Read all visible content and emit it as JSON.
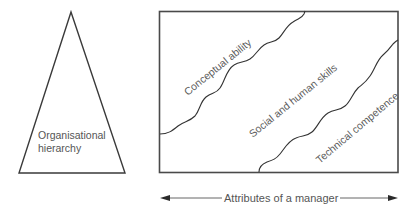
{
  "diagram": {
    "title": "",
    "left_figure": {
      "shape": "triangle",
      "label_lines": [
        "Organisational",
        "hierarchy"
      ]
    },
    "right_figure": {
      "shape": "rectangle",
      "regions": [
        {
          "id": "conceptual",
          "label": "Conceptual ability"
        },
        {
          "id": "social",
          "label": "Social and human skills"
        },
        {
          "id": "technical",
          "label": "Technical competence"
        }
      ],
      "dividers": [
        {
          "between": [
            "Conceptual ability",
            "Social and human skills"
          ],
          "style": "wavy"
        },
        {
          "between": [
            "Social and human skills",
            "Technical competence"
          ],
          "style": "wavy"
        }
      ]
    },
    "axis": {
      "label": "Attributes of a manager",
      "arrow": "double-headed"
    },
    "colors": {
      "line": "#3a3a3a",
      "text": "#5a5a5a",
      "background": "#ffffff"
    }
  }
}
